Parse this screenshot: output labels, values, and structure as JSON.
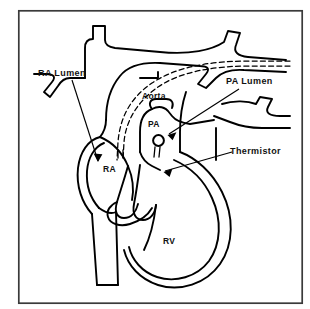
{
  "figure": {
    "background_color": "#ffffff",
    "line_color": "#000000",
    "frame": {
      "name": "diagram-border",
      "x": 18,
      "y": 10,
      "width": 285,
      "height": 294,
      "stroke": "#3a3a3a",
      "stroke_width": 1.6
    }
  },
  "labels": {
    "ra_lumen": {
      "text": "RA  Lumen",
      "x": 38,
      "y": 76
    },
    "pa_lumen": {
      "text": "PA  Lumen",
      "x": 226,
      "y": 84
    },
    "thermistor": {
      "text": "Thermistor",
      "x": 230,
      "y": 154
    },
    "aorta": {
      "text": "Aorta",
      "x": 142,
      "y": 99
    },
    "pa": {
      "text": "PA",
      "x": 148,
      "y": 127
    },
    "ra": {
      "text": "RA",
      "x": 103,
      "y": 172
    },
    "rv": {
      "text": "RV",
      "x": 163,
      "y": 244
    }
  },
  "structures": {
    "aorta_name": "aortic-arch",
    "pa_name": "pulmonary-artery",
    "ra_name": "right-atrium",
    "rv_name": "right-ventricle",
    "svc_name": "superior-vena-cava",
    "ivc_name": "inferior-vena-cava",
    "tricuspid_name": "tricuspid-valve",
    "catheter_name": "swan-ganz-catheter",
    "thermistor_bead_name": "thermistor-bead"
  },
  "thermistor_bead": {
    "cx": 158.5,
    "cy": 140.5,
    "r": 5.2
  },
  "leaders": {
    "ra_lumen_line": "M 72,80 L 98,162",
    "ra_lumen_arrow": "M 98,162 L 94.2,153.8 L 102.2,154.6 Z",
    "pa_lumen_line": "M 238,90 L 168,135",
    "pa_lumen_arrow": "M 168,135 L 176.6,132.6 L 172.8,139.8 Z",
    "thermistor_line": "M 232,153 L 164,172",
    "thermistor_arrow": "M 164,172 L 172.4,169.2 L 169.4,176.6 Z"
  }
}
